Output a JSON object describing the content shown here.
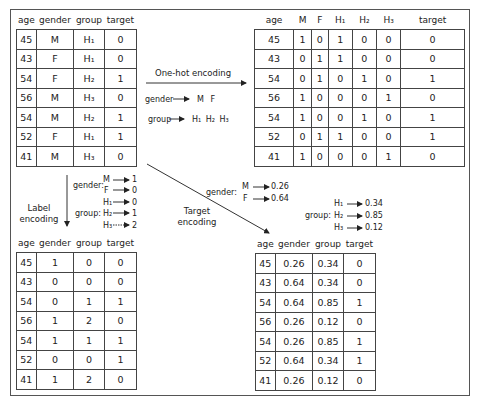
{
  "original_table": {
    "headers": [
      "age",
      "gender",
      "group",
      "target"
    ],
    "rows": [
      [
        "45",
        "M",
        "H₁",
        "0"
      ],
      [
        "43",
        "F",
        "H₁",
        "0"
      ],
      [
        "54",
        "F",
        "H₂",
        "1"
      ],
      [
        "56",
        "M",
        "H₃",
        "0"
      ],
      [
        "54",
        "M",
        "H₂",
        "1"
      ],
      [
        "52",
        "F",
        "H₁",
        "1"
      ],
      [
        "41",
        "M",
        "H₃",
        "0"
      ]
    ]
  },
  "one_hot": {
    "arrow_label": "One-hot encoding",
    "gender_label": "gender",
    "gender_values": "M   F",
    "group_label": "group",
    "group_values": "H₁  H₂  H₃",
    "table": {
      "headers": [
        "age",
        "M",
        "F",
        "H₁",
        "H₂",
        "H₃",
        "target"
      ],
      "rows": [
        [
          "45",
          "1",
          "0",
          "1",
          "0",
          "0",
          "0"
        ],
        [
          "43",
          "0",
          "1",
          "1",
          "0",
          "0",
          "0"
        ],
        [
          "54",
          "0",
          "1",
          "0",
          "1",
          "0",
          "1"
        ],
        [
          "56",
          "1",
          "0",
          "0",
          "0",
          "1",
          "0"
        ],
        [
          "54",
          "1",
          "0",
          "0",
          "1",
          "0",
          "1"
        ],
        [
          "52",
          "0",
          "1",
          "1",
          "0",
          "0",
          "1"
        ],
        [
          "41",
          "1",
          "0",
          "0",
          "0",
          "1",
          "0"
        ]
      ]
    }
  },
  "label_encoding": {
    "arrow_label_line1": "Label",
    "arrow_label_line2": "encoding",
    "gender_label": "gender:",
    "gender_map": [
      {
        "key": "M",
        "value": "1"
      },
      {
        "key": "F",
        "value": "0"
      }
    ],
    "group_label": "group:",
    "group_map": [
      {
        "key": "H₁",
        "value": "0"
      },
      {
        "key": "H₂",
        "value": "1"
      },
      {
        "key": "H₃",
        "value": "2"
      }
    ],
    "table": {
      "headers": [
        "age",
        "gender",
        "group",
        "target"
      ],
      "rows": [
        [
          "45",
          "1",
          "0",
          "0"
        ],
        [
          "43",
          "0",
          "0",
          "0"
        ],
        [
          "54",
          "0",
          "1",
          "1"
        ],
        [
          "56",
          "1",
          "2",
          "0"
        ],
        [
          "54",
          "1",
          "1",
          "1"
        ],
        [
          "52",
          "0",
          "0",
          "1"
        ],
        [
          "41",
          "1",
          "2",
          "0"
        ]
      ]
    }
  },
  "target_encoding": {
    "arrow_label_line1": "Target",
    "arrow_label_line2": "encoding",
    "gender_label": "gender:",
    "gender_map": [
      {
        "key": "M",
        "value": "0.26"
      },
      {
        "key": "F",
        "value": "0.64"
      }
    ],
    "group_label": "group:",
    "group_map": [
      {
        "key": "H₁",
        "value": "0.34"
      },
      {
        "key": "H₂",
        "value": "0.85"
      },
      {
        "key": "H₃",
        "value": "0.12"
      }
    ],
    "table": {
      "headers": [
        "age",
        "gender",
        "group",
        "target"
      ],
      "rows": [
        [
          "45",
          "0.26",
          "0.34",
          "0"
        ],
        [
          "43",
          "0.64",
          "0.34",
          "0"
        ],
        [
          "54",
          "0.64",
          "0.85",
          "1"
        ],
        [
          "56",
          "0.26",
          "0.12",
          "0"
        ],
        [
          "54",
          "0.26",
          "0.85",
          "1"
        ],
        [
          "52",
          "0.64",
          "0.34",
          "1"
        ],
        [
          "41",
          "0.26",
          "0.12",
          "0"
        ]
      ]
    }
  }
}
